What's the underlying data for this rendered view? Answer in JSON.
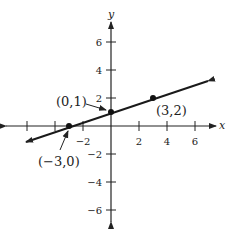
{
  "diagram": {
    "type": "coordinate-plane-line",
    "axes": {
      "x_label": "x",
      "y_label": "y",
      "x_ticks": [
        {
          "value": -6,
          "label": ""
        },
        {
          "value": -4,
          "label": ""
        },
        {
          "value": -2,
          "label": "−2"
        },
        {
          "value": 2,
          "label": "2"
        },
        {
          "value": 4,
          "label": "4"
        },
        {
          "value": 6,
          "label": "6"
        }
      ],
      "y_ticks": [
        {
          "value": 6,
          "label": "6"
        },
        {
          "value": 4,
          "label": "4"
        },
        {
          "value": 2,
          "label": "2"
        },
        {
          "value": -2,
          "label": "−2"
        },
        {
          "value": -4,
          "label": "−4"
        },
        {
          "value": -6,
          "label": "−6"
        }
      ]
    },
    "line": {
      "slope": "1/3",
      "y_intercept": 1,
      "color": "#1a1a1a"
    },
    "points": [
      {
        "x": -3,
        "y": 0,
        "label": "(−3,0)"
      },
      {
        "x": 0,
        "y": 1,
        "label": "(0,1)"
      },
      {
        "x": 3,
        "y": 2,
        "label": "(3,2)"
      }
    ]
  }
}
